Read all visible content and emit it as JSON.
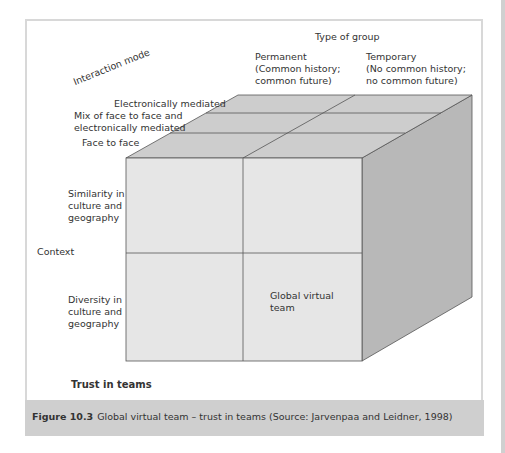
{
  "figure": {
    "axis_group_title": "Type of group",
    "axis_interaction_title": "Interaction mode",
    "axis_context_title": "Context",
    "group_types": [
      {
        "line1": "Permanent",
        "line2": "(Common history;",
        "line3": "common future)"
      },
      {
        "line1": "Temporary",
        "line2": "(No common history;",
        "line3": "no common future)"
      }
    ],
    "interaction_modes": [
      {
        "line1": "Electronically mediated"
      },
      {
        "line1": "Mix of face to face and",
        "line2": "electronically mediated"
      },
      {
        "line1": "Face to face"
      }
    ],
    "contexts": [
      {
        "line1": "Similarity in",
        "line2": "culture and",
        "line3": "geography"
      },
      {
        "line1": "Diversity in",
        "line2": "culture and",
        "line3": "geography"
      }
    ],
    "highlight_cell": {
      "line1": "Global virtual",
      "line2": "team"
    },
    "footer_title": "Trust in teams"
  },
  "caption": {
    "label": "Figure 10.3",
    "text": "Global virtual team – trust in teams (Source: Jarvenpaa and Leidner, 1998)"
  },
  "colors": {
    "front_face": "#e6e6e6",
    "top_face": "#cdcdcd",
    "right_face": "#b8b8b8",
    "edge": "#555555",
    "caption_band": "#cfcfcf"
  }
}
